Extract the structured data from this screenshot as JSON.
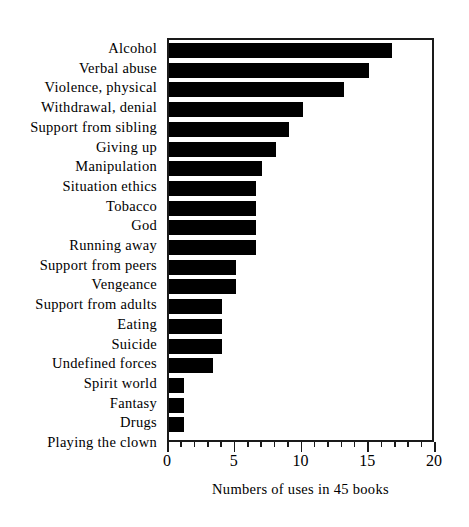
{
  "chart_data": {
    "type": "bar",
    "orientation": "horizontal",
    "title": "",
    "xlabel": "Numbers of uses in 45 books",
    "ylabel": "",
    "xlim": [
      0,
      20
    ],
    "xticks": [
      0,
      5,
      10,
      15,
      20
    ],
    "xtick_labels": [
      "0",
      "5",
      "10",
      "15",
      "20"
    ],
    "minor_tick_interval": 1,
    "grid": false,
    "legend": null,
    "bar_color": "#000000",
    "frame_color": "#1a1a1a",
    "background": "#ffffff",
    "categories": [
      "Alcohol",
      "Verbal abuse",
      "Violence, physical",
      "Withdrawal, denial",
      "Support from sibling",
      "Giving up",
      "Manipulation",
      "Situation ethics",
      "Tobacco",
      "God",
      "Running away",
      "Support from peers",
      "Vengeance",
      "Support from adults",
      "Eating",
      "Suicide",
      "Undefined forces",
      "Spirit world",
      "Fantasy",
      "Drugs",
      "Playing the clown"
    ],
    "values": [
      16.7,
      15.0,
      13.1,
      10.0,
      9.0,
      8.0,
      7.0,
      6.5,
      6.5,
      6.5,
      6.5,
      5.0,
      5.0,
      4.0,
      4.0,
      4.0,
      3.3,
      1.1,
      1.1,
      1.1,
      0
    ]
  }
}
